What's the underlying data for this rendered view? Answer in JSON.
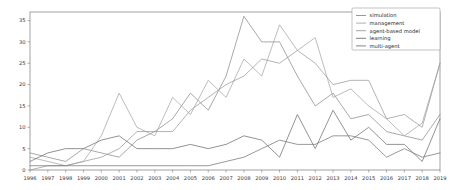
{
  "chart_data": {
    "type": "line",
    "title": "",
    "xlabel": "",
    "ylabel": "",
    "xlim": [
      1996,
      2019
    ],
    "ylim": [
      0,
      37
    ],
    "grid": false,
    "legend_position": "top-right",
    "categories": [
      1996,
      1997,
      1998,
      1999,
      2000,
      2001,
      2002,
      2003,
      2004,
      2005,
      2006,
      2007,
      2008,
      2009,
      2010,
      2011,
      2012,
      2013,
      2014,
      2015,
      2016,
      2017,
      2018,
      2019
    ],
    "xtick_labels": [
      "1996",
      "1997",
      "1998",
      "1999",
      "2000",
      "2001",
      "2002",
      "2003",
      "2004",
      "2005",
      "2006",
      "2007",
      "2008",
      "2009",
      "2010",
      "2011",
      "2012",
      "2013",
      "2014",
      "2015",
      "2016",
      "2017",
      "2018",
      "2019"
    ],
    "ytick_labels": [
      "0",
      "5",
      "10",
      "15",
      "20",
      "25",
      "30",
      "35"
    ],
    "yticks": [
      0,
      5,
      10,
      15,
      20,
      25,
      30,
      35
    ],
    "series": [
      {
        "name": "simulation",
        "color": "#8c8c8c",
        "values": [
          4,
          3,
          2,
          5,
          4,
          3,
          7,
          9,
          12,
          18,
          14,
          22,
          36,
          30,
          30,
          22,
          15,
          18,
          12,
          13,
          9,
          8,
          7,
          13
        ]
      },
      {
        "name": "management",
        "color": "#a6a6a6",
        "values": [
          3,
          2,
          1,
          2,
          8,
          18,
          10,
          8,
          17,
          13,
          21,
          17,
          26,
          22,
          34,
          28,
          31,
          17,
          19,
          15,
          12,
          8,
          11,
          25
        ]
      },
      {
        "name": "agent-based model",
        "color": "#9a9a9a",
        "values": [
          0,
          1,
          1,
          2,
          3,
          5,
          9,
          9,
          9,
          14,
          17,
          20,
          22,
          26,
          25,
          28,
          25,
          20,
          21,
          21,
          12,
          13,
          10,
          25
        ]
      },
      {
        "name": "learning",
        "color": "#6f6f6f",
        "values": [
          2,
          4,
          5,
          5,
          7,
          8,
          5,
          5,
          5,
          6,
          5,
          6,
          8,
          7,
          3,
          13,
          5,
          14,
          7,
          10,
          6,
          6,
          2,
          12
        ]
      },
      {
        "name": "multi-agent",
        "color": "#777777",
        "values": [
          1,
          1,
          1,
          1,
          1,
          1,
          1,
          1,
          1,
          1,
          1,
          2,
          3,
          5,
          7,
          6,
          6,
          8,
          8,
          7,
          3,
          5,
          3,
          4
        ]
      }
    ]
  },
  "legend": {
    "entries": [
      "simulation",
      "management",
      "agent-based model",
      "learning",
      "multi-agent"
    ]
  }
}
